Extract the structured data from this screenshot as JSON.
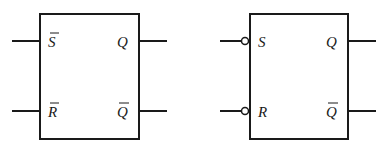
{
  "diagram": {
    "stroke_color": "#1a1a1a",
    "left_block": {
      "inputs": [
        {
          "label": "S",
          "overbar": true
        },
        {
          "label": "R",
          "overbar": true
        }
      ],
      "outputs": [
        {
          "label": "Q",
          "overbar": false
        },
        {
          "label": "Q",
          "overbar": true
        }
      ]
    },
    "right_block": {
      "inputs": [
        {
          "label": "S",
          "overbar": false,
          "inversion_bubble": true
        },
        {
          "label": "R",
          "overbar": false,
          "inversion_bubble": true
        }
      ],
      "outputs": [
        {
          "label": "Q",
          "overbar": false
        },
        {
          "label": "Q",
          "overbar": true
        }
      ]
    }
  }
}
